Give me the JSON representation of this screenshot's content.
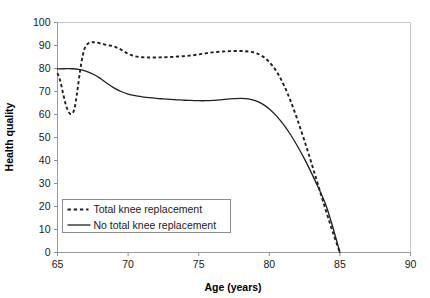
{
  "chart_data": {
    "type": "line",
    "title": "",
    "xlabel": "Age (years)",
    "ylabel": "Health quality",
    "xlim": [
      65,
      90
    ],
    "ylim": [
      0,
      100
    ],
    "xticks": [
      65,
      70,
      75,
      80,
      85,
      90
    ],
    "yticks": [
      0,
      10,
      20,
      30,
      40,
      50,
      60,
      70,
      80,
      90,
      100
    ],
    "grid": false,
    "legend_position": "lower-left-inside",
    "series": [
      {
        "name": "Total knee replacement",
        "style": "dashed",
        "color": "#231f20",
        "x": [
          65.0,
          65.2,
          65.4,
          65.6,
          65.8,
          66.0,
          66.2,
          66.4,
          66.6,
          66.8,
          67.0,
          67.3,
          67.6,
          68.0,
          68.5,
          69.0,
          69.5,
          70.0,
          70.5,
          71.0,
          71.5,
          72.0,
          72.5,
          73.0,
          73.5,
          74.0,
          74.5,
          75.0,
          75.5,
          76.0,
          76.5,
          77.0,
          77.5,
          78.0,
          78.5,
          79.0,
          79.5,
          80.0,
          80.5,
          81.0,
          81.5,
          82.0,
          82.5,
          83.0,
          83.5,
          84.0,
          84.5,
          85.0
        ],
        "y": [
          78.0,
          74.5,
          69.0,
          64.0,
          61.0,
          60.2,
          62.5,
          70.0,
          79.0,
          86.0,
          89.8,
          91.3,
          91.4,
          91.0,
          90.2,
          89.6,
          88.2,
          86.4,
          85.3,
          84.9,
          84.8,
          84.8,
          84.9,
          85.0,
          85.2,
          85.4,
          85.7,
          86.1,
          86.6,
          87.0,
          87.3,
          87.5,
          87.6,
          87.6,
          87.4,
          86.8,
          85.4,
          82.8,
          78.8,
          73.2,
          66.0,
          57.6,
          48.4,
          38.6,
          28.4,
          18.4,
          8.8,
          0.0
        ]
      },
      {
        "name": "No total knee replacement",
        "style": "solid",
        "color": "#231f20",
        "x": [
          65.0,
          65.5,
          66.0,
          66.5,
          67.0,
          67.5,
          68.0,
          68.5,
          69.0,
          69.5,
          70.0,
          70.5,
          71.0,
          71.5,
          72.0,
          72.5,
          73.0,
          73.5,
          74.0,
          74.5,
          75.0,
          75.5,
          76.0,
          76.5,
          77.0,
          77.5,
          78.0,
          78.5,
          79.0,
          79.5,
          80.0,
          80.5,
          81.0,
          81.5,
          82.0,
          82.5,
          83.0,
          83.5,
          84.0,
          84.5,
          85.0
        ],
        "y": [
          79.8,
          79.9,
          79.9,
          79.6,
          78.9,
          77.6,
          75.8,
          73.6,
          71.6,
          70.0,
          68.9,
          68.2,
          67.7,
          67.3,
          67.0,
          66.8,
          66.6,
          66.4,
          66.2,
          66.1,
          66.0,
          66.0,
          66.1,
          66.4,
          66.7,
          66.9,
          67.0,
          66.8,
          66.0,
          64.6,
          62.4,
          59.4,
          55.7,
          51.3,
          46.2,
          40.6,
          34.4,
          27.8,
          20.8,
          11.0,
          0.0
        ]
      }
    ]
  },
  "legend": {
    "items": [
      {
        "label": "Total knee replacement",
        "style": "dashed"
      },
      {
        "label": "No total knee replacement",
        "style": "solid"
      }
    ]
  },
  "axes": {
    "x_title": "Age (years)",
    "y_title": "Health quality",
    "x_tick_labels": [
      "65",
      "70",
      "75",
      "80",
      "85",
      "90"
    ],
    "y_tick_labels": [
      "0",
      "10",
      "20",
      "30",
      "40",
      "50",
      "60",
      "70",
      "80",
      "90",
      "100"
    ]
  },
  "colors": {
    "series_ink": "#231f20",
    "axis": "#9a9a9a",
    "frame": "#c8c8c8",
    "text": "#1a1a1a"
  }
}
